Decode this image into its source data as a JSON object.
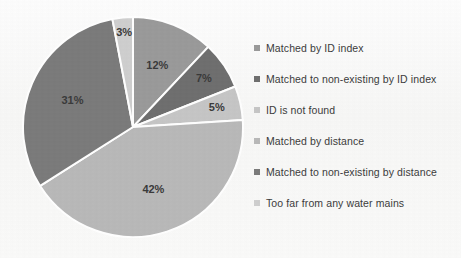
{
  "background_color": "#fbfbfb",
  "chart_data": {
    "type": "pie",
    "title": "",
    "labels": [
      "Matched by ID index",
      "Matched to non-existing by ID index",
      "ID is not found",
      "Matched by distance",
      "Matched to non-existing by distance",
      "Too far from any water mains"
    ],
    "values": [
      12,
      7,
      5,
      42,
      31,
      3
    ],
    "value_labels": [
      "12%",
      "7%",
      "5%",
      "42%",
      "31%",
      "3%"
    ],
    "colors": [
      "#9a9a9a",
      "#6f6f6f",
      "#c6c6c6",
      "#b9b9b9",
      "#7b7b7b",
      "#cfcfcf"
    ],
    "units": "percent",
    "start_angle_deg": 0,
    "direction": "clockwise",
    "separator_color": "#ffffff",
    "label_color": "#3a3a3a",
    "legend": {
      "position": "right",
      "entries": [
        {
          "label": "Matched by ID index",
          "color": "#9a9a9a",
          "marker": "square-marker"
        },
        {
          "label": "Matched to non-existing by ID index",
          "color": "#6f6f6f",
          "marker": "square-marker"
        },
        {
          "label": "ID is not found",
          "color": "#c6c6c6",
          "marker": "square-marker"
        },
        {
          "label": "Matched by distance",
          "color": "#b9b9b9",
          "marker": "square-marker"
        },
        {
          "label": "Matched to non-existing by distance",
          "color": "#7b7b7b",
          "marker": "square-marker"
        },
        {
          "label": "Too far from any water mains",
          "color": "#cfcfcf",
          "marker": "square-marker"
        }
      ]
    },
    "geometry": {
      "center_x": 111,
      "center_y": 111,
      "radius": 110
    }
  }
}
